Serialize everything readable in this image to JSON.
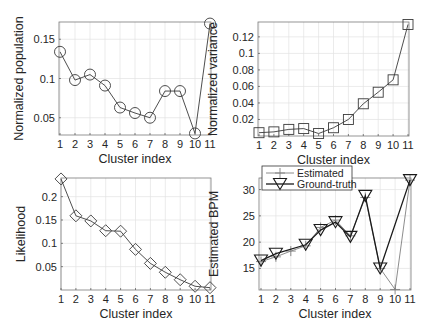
{
  "chart_data": [
    {
      "id": "population",
      "type": "line",
      "title": "",
      "xlabel": "Cluster index",
      "ylabel": "Normalized population",
      "x": [
        1,
        2,
        3,
        4,
        5,
        6,
        7,
        8,
        9,
        10,
        11
      ],
      "xticks": [
        "1",
        "2",
        "3",
        "4",
        "5",
        "6",
        "7",
        "8",
        "9",
        "10",
        "11"
      ],
      "yticks": [
        0.05,
        0.1,
        0.15
      ],
      "ytick_labels": [
        "0.05",
        "0.1",
        "0.15"
      ],
      "ylim": [
        0.028,
        0.172
      ],
      "grid": true,
      "marker": "circle",
      "series": [
        {
          "name": "Normalized population",
          "values": [
            0.134,
            0.098,
            0.105,
            0.091,
            0.063,
            0.056,
            0.05,
            0.084,
            0.084,
            0.03,
            0.17
          ]
        }
      ]
    },
    {
      "id": "variance",
      "type": "line",
      "title": "",
      "xlabel": "Cluster index",
      "ylabel": "Normalized variance",
      "x": [
        1,
        2,
        3,
        4,
        5,
        6,
        7,
        8,
        9,
        10,
        11
      ],
      "xticks": [
        "1",
        "2",
        "3",
        "4",
        "5",
        "6",
        "7",
        "8",
        "9",
        "10",
        "11"
      ],
      "yticks": [
        0.02,
        0.04,
        0.06,
        0.08,
        0.1,
        0.12
      ],
      "ytick_labels": [
        "0.02",
        "0.04",
        "0.06",
        "0.08",
        "0.1",
        "0.12"
      ],
      "ylim": [
        0.0,
        0.138
      ],
      "grid": true,
      "marker": "square",
      "series": [
        {
          "name": "Normalized variance",
          "values": [
            0.004,
            0.005,
            0.008,
            0.009,
            0.003,
            0.01,
            0.02,
            0.039,
            0.053,
            0.068,
            0.135
          ]
        }
      ]
    },
    {
      "id": "likelihood",
      "type": "line",
      "title": "",
      "xlabel": "Cluster index",
      "ylabel": "Likelihood",
      "x": [
        1,
        2,
        3,
        4,
        5,
        6,
        7,
        8,
        9,
        10,
        11
      ],
      "xticks": [
        "1",
        "2",
        "3",
        "4",
        "5",
        "6",
        "7",
        "8",
        "9",
        "10",
        "11"
      ],
      "yticks": [
        0.05,
        0.1,
        0.15,
        0.2
      ],
      "ytick_labels": [
        "0.05",
        "0.1",
        "0.15",
        "0.2"
      ],
      "ylim": [
        0.0,
        0.24
      ],
      "grid": true,
      "marker": "diamond",
      "series": [
        {
          "name": "Likelihood",
          "values": [
            0.238,
            0.159,
            0.148,
            0.127,
            0.126,
            0.087,
            0.057,
            0.038,
            0.022,
            0.008,
            0.005
          ]
        }
      ]
    },
    {
      "id": "bpm",
      "type": "line",
      "title": "",
      "xlabel": "Cluster index",
      "ylabel": "Estimated BPM",
      "x": [
        1,
        2,
        3,
        4,
        5,
        6,
        7,
        8,
        9,
        10,
        11
      ],
      "xticks": [
        "1",
        "2",
        "3",
        "4",
        "5",
        "6",
        "7",
        "8",
        "9",
        "10",
        "11"
      ],
      "yticks": [
        15,
        20,
        25,
        30
      ],
      "ytick_labels": [
        "15",
        "20",
        "25",
        "30"
      ],
      "ylim": [
        10.9,
        32.2
      ],
      "grid": true,
      "legend": {
        "position": "top-left",
        "entries": [
          "Estimated",
          "Ground-truth"
        ]
      },
      "series": [
        {
          "name": "Estimated",
          "marker": "plus",
          "color": "#808080",
          "values": [
            16.3,
            17.2,
            18.3,
            19.3,
            22.8,
            24.2,
            21.2,
            28.5,
            15.0,
            11.0,
            31.8
          ]
        },
        {
          "name": "Ground-truth",
          "marker": "triangle-down",
          "color": "#1a1a1a",
          "values": [
            16.5,
            17.8,
            null,
            19.5,
            22.3,
            23.8,
            21.0,
            28.8,
            15.0,
            null,
            31.8
          ]
        }
      ]
    }
  ],
  "layout": {
    "panels": [
      {
        "left": 59,
        "right": 211,
        "top": 22,
        "bottom": 135,
        "tick0": 60,
        "tick10": 210
      },
      {
        "left": 258,
        "right": 409,
        "top": 22,
        "bottom": 136,
        "tick0": 259,
        "tick10": 408
      },
      {
        "left": 61,
        "right": 211,
        "top": 178,
        "bottom": 290,
        "tick0": 61,
        "tick10": 210
      },
      {
        "left": 259,
        "right": 411,
        "top": 178,
        "bottom": 290,
        "tick0": 261,
        "tick10": 410
      }
    ]
  }
}
